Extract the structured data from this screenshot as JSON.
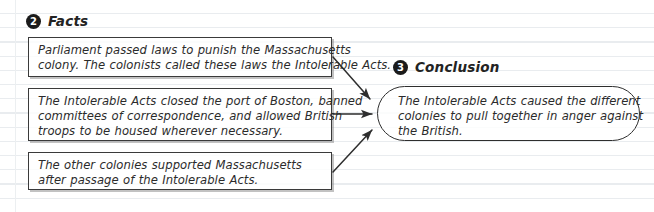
{
  "page": {
    "background": "#ffffff",
    "rule_color": "#e9ecef",
    "ink_color": "#2b2b2b"
  },
  "sections": {
    "facts": {
      "number": "2",
      "label": "Facts"
    },
    "conclusion": {
      "number": "3",
      "label": "Conclusion"
    }
  },
  "facts": [
    {
      "lines": [
        "Parliament passed laws to punish the Massachusetts",
        "colony. The colonists called these laws the Intolerable Acts."
      ]
    },
    {
      "lines": [
        "The Intolerable Acts closed the port of Boston, banned",
        "committees of correspondence, and allowed British",
        "troops to be housed wherever necessary."
      ]
    },
    {
      "lines": [
        "The other colonies supported Massachusetts",
        "after passage of the Intolerable Acts."
      ]
    }
  ],
  "conclusion": {
    "lines": [
      "The Intolerable Acts caused the different",
      "colonies to pull together in anger against",
      "the British."
    ]
  },
  "connectors": [
    {
      "name": "arrow-fact-1-to-conclusion"
    },
    {
      "name": "arrow-fact-2-to-conclusion"
    },
    {
      "name": "arrow-fact-3-to-conclusion"
    }
  ]
}
